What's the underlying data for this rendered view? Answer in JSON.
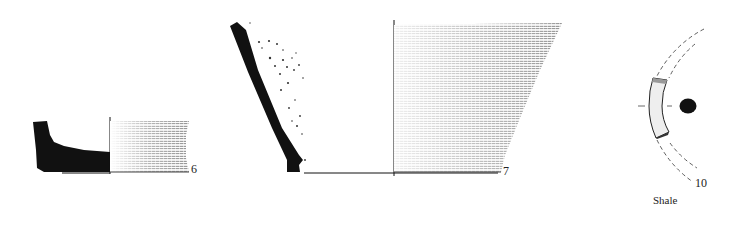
{
  "figure": {
    "objects": [
      {
        "id": "vessel-6",
        "number": "6",
        "type": "pottery base profile"
      },
      {
        "id": "vessel-7",
        "number": "7",
        "type": "pottery wall profile"
      },
      {
        "id": "object-10",
        "number": "10",
        "type": "ring fragment",
        "material": "Shale"
      }
    ]
  },
  "labels": {
    "n6": "6",
    "n7": "7",
    "n10": "10",
    "shale": "Shale"
  },
  "colors": {
    "ink": "#111111",
    "stipple": "#333333",
    "background": "#ffffff"
  }
}
